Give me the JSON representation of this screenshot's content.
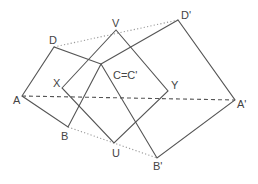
{
  "diagram": {
    "type": "geometry",
    "colors": {
      "line": "#555555",
      "dotted": "#9a9a9a",
      "label": "#444444",
      "background": "#ffffff"
    },
    "points": {
      "A": {
        "x": 22,
        "y": 96,
        "label": "A"
      },
      "B": {
        "x": 68,
        "y": 127,
        "label": "B"
      },
      "C": {
        "x": 101,
        "y": 64,
        "label": "C=C'"
      },
      "D": {
        "x": 54,
        "y": 47,
        "label": "D"
      },
      "A2": {
        "x": 235,
        "y": 100,
        "label": "A'"
      },
      "B2": {
        "x": 157,
        "y": 158,
        "label": "B'"
      },
      "D2": {
        "x": 178,
        "y": 20,
        "label": "D'"
      },
      "X": {
        "x": 62,
        "y": 88,
        "label": "X"
      },
      "Y": {
        "x": 168,
        "y": 91,
        "label": "Y"
      },
      "V": {
        "x": 116,
        "y": 30,
        "label": "V"
      },
      "U": {
        "x": 114,
        "y": 143,
        "label": "U"
      }
    },
    "labels": {
      "A": "A",
      "B": "B",
      "C": "C=C'",
      "D": "D",
      "A2": "A'",
      "B2": "B'",
      "D2": "D'",
      "X": "X",
      "Y": "Y",
      "V": "V",
      "U": "U"
    },
    "segments": {
      "solid": [
        [
          "A",
          "D"
        ],
        [
          "D",
          "C"
        ],
        [
          "C",
          "B"
        ],
        [
          "B",
          "A"
        ],
        [
          "C",
          "D2"
        ],
        [
          "D2",
          "A2"
        ],
        [
          "A2",
          "B2"
        ],
        [
          "B2",
          "C"
        ],
        [
          "X",
          "V"
        ],
        [
          "V",
          "Y"
        ],
        [
          "Y",
          "U"
        ],
        [
          "U",
          "X"
        ]
      ],
      "dotted": [
        [
          "D",
          "D2"
        ],
        [
          "B",
          "B2"
        ]
      ],
      "dashed": [
        [
          "A",
          "A2"
        ]
      ]
    }
  }
}
